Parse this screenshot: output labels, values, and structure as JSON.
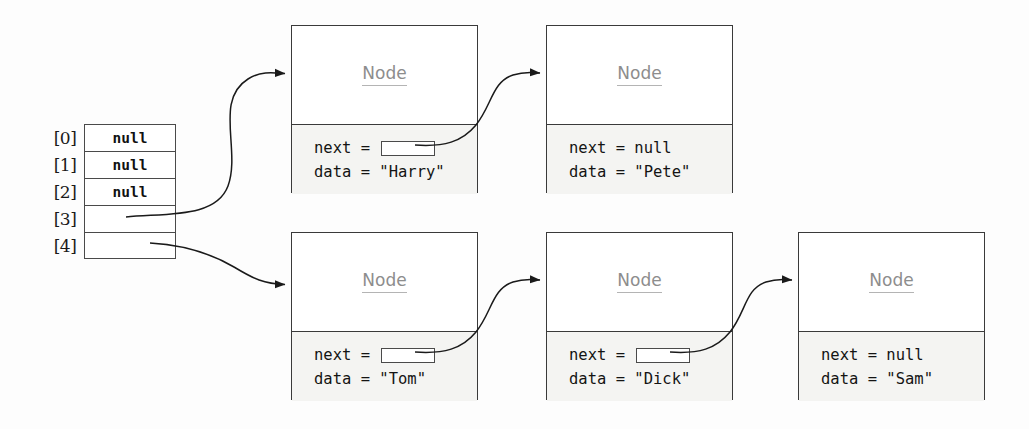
{
  "diagram": {
    "colors": {
      "node_header_bg": "#ffffff",
      "node_body_bg": "#f4f4f2",
      "node_title_text": "#8d8d8d",
      "border": "#3a3a3a",
      "arrow": "#1a1a1a",
      "page_bg": "#fdfdfd"
    }
  },
  "array": {
    "name": "bucket-array",
    "rows": [
      {
        "index": "[0]",
        "value": "null"
      },
      {
        "index": "[1]",
        "value": "null"
      },
      {
        "index": "[2]",
        "value": "null"
      },
      {
        "index": "[3]",
        "value": ""
      },
      {
        "index": "[4]",
        "value": ""
      }
    ]
  },
  "nodes": [
    {
      "id": "node-harry",
      "title": "Node",
      "next_label": "next = ",
      "next_value": "",
      "next_is_pointer": true,
      "data_label": "data = ",
      "data_value": "\"Harry\""
    },
    {
      "id": "node-pete",
      "title": "Node",
      "next_label": "next = ",
      "next_value": "null",
      "next_is_pointer": false,
      "data_label": "data = ",
      "data_value": "\"Pete\""
    },
    {
      "id": "node-tom",
      "title": "Node",
      "next_label": "next = ",
      "next_value": "",
      "next_is_pointer": true,
      "data_label": "data = ",
      "data_value": "\"Tom\""
    },
    {
      "id": "node-dick",
      "title": "Node",
      "next_label": "next = ",
      "next_value": "",
      "next_is_pointer": true,
      "data_label": "data = ",
      "data_value": "\"Dick\""
    },
    {
      "id": "node-sam",
      "title": "Node",
      "next_label": "next = ",
      "next_value": "null",
      "next_is_pointer": false,
      "data_label": "data = ",
      "data_value": "\"Sam\""
    }
  ],
  "connections": [
    {
      "from": "array[3]",
      "to": "node-harry"
    },
    {
      "from": "node-harry.next",
      "to": "node-pete"
    },
    {
      "from": "array[4]",
      "to": "node-tom"
    },
    {
      "from": "node-tom.next",
      "to": "node-dick"
    },
    {
      "from": "node-dick.next",
      "to": "node-sam"
    }
  ]
}
